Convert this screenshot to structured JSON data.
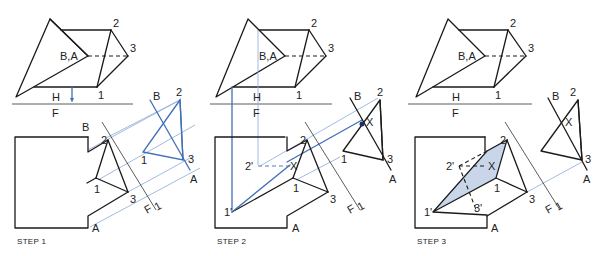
{
  "figure": {
    "panels": [
      {
        "step_label": "STEP 1",
        "top_view_labels": {
          "pt2": "2",
          "pt3": "3",
          "ba": "B,A",
          "pt1": "1",
          "h": "H",
          "f": "F"
        },
        "front_view_labels": {
          "b": "B",
          "pt2": "2",
          "pt1": "1",
          "pt3": "3",
          "a": "A",
          "f": "F",
          "one": "1"
        },
        "aux_view_labels": {
          "b": "B",
          "pt2": "2",
          "pt1": "1",
          "pt3": "3",
          "a": "A"
        }
      },
      {
        "step_label": "STEP 2",
        "top_view_labels": {
          "pt2": "2",
          "pt3": "3",
          "ba": "B,A",
          "pt1": "1",
          "h": "H",
          "f": "F"
        },
        "front_view_labels": {
          "pt2p": "2'",
          "x": "X",
          "pt2": "2",
          "pt1": "1",
          "pt1p": "1'",
          "pt3": "3",
          "a": "A",
          "f": "F",
          "one": "1"
        },
        "aux_view_labels": {
          "b": "B",
          "pt2": "2",
          "x": "X",
          "pt1": "1",
          "pt3": "3",
          "a": "A"
        }
      },
      {
        "step_label": "STEP 3",
        "top_view_labels": {
          "pt2": "2",
          "pt3": "3",
          "ba": "B,A",
          "pt1": "1",
          "h": "H",
          "f": "F"
        },
        "front_view_labels": {
          "pt2p": "2'",
          "x": "X",
          "pt2": "2",
          "pt1": "1",
          "pt1p": "1'",
          "pt3p": "3'",
          "pt3": "3",
          "a": "A",
          "f": "F",
          "one": "1"
        },
        "aux_view_labels": {
          "b": "B",
          "pt2": "2",
          "x": "X",
          "pt1": "1",
          "pt3": "3",
          "a": "A"
        }
      }
    ],
    "colors": {
      "line": "#1a1a1a",
      "construction": "#3f6fb5",
      "projector": "#8aa8d8",
      "shade": "#c9d6ea"
    }
  }
}
